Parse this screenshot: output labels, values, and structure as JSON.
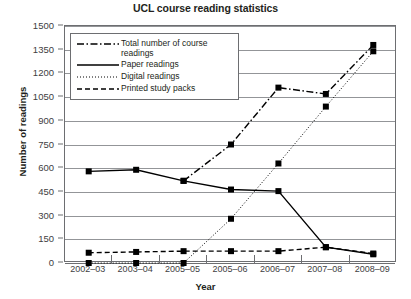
{
  "chart_data": {
    "type": "line",
    "title": "UCL course reading statistics",
    "xlabel": "Year",
    "ylabel": "Number of readings",
    "categories": [
      "2002–03",
      "2003–04",
      "2005–05",
      "2005–06",
      "2006–07",
      "2007–08",
      "2008–09"
    ],
    "ylim": [
      0,
      1500
    ],
    "yticks": [
      0,
      150,
      300,
      450,
      600,
      750,
      900,
      1050,
      1200,
      1350,
      1500
    ],
    "ytick_labels": [
      "0",
      "150",
      "300",
      "450",
      "600",
      "750",
      "900",
      "1050",
      "1200",
      "1350",
      "1500"
    ],
    "grid": true,
    "legend_position": "upper-left-inside",
    "series": [
      {
        "name": "Total number of course readings",
        "style": "dash-dot",
        "marker": "square",
        "values": [
          null,
          null,
          520,
          750,
          1110,
          1070,
          1380
        ]
      },
      {
        "name": "Paper readings",
        "style": "solid",
        "marker": "square",
        "values": [
          580,
          590,
          520,
          465,
          455,
          100,
          55
        ]
      },
      {
        "name": "Digital readings",
        "style": "dotted",
        "marker": "square",
        "values": [
          0,
          0,
          0,
          280,
          630,
          990,
          1340
        ]
      },
      {
        "name": "Printed study packs",
        "style": "dashed",
        "marker": "square",
        "values": [
          65,
          70,
          75,
          75,
          75,
          100,
          60
        ]
      }
    ],
    "colors": {
      "line": "#000000",
      "grid": "#939598",
      "axis": "#6d6e71",
      "text": "#231f20",
      "background": "#ffffff"
    }
  },
  "legend": {
    "items": [
      {
        "label": "Total number of course\nreadings",
        "style": "dash-dot"
      },
      {
        "label": "Paper readings",
        "style": "solid"
      },
      {
        "label": "Digital readings",
        "style": "dotted"
      },
      {
        "label": "Printed study packs",
        "style": "dashed"
      }
    ]
  }
}
